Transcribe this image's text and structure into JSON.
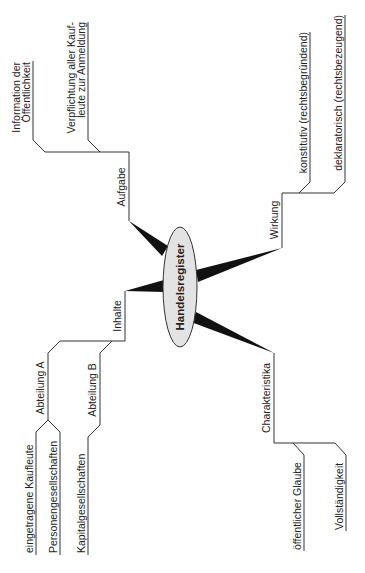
{
  "diagram": {
    "type": "mind-map",
    "orientation": "rotated-90-ccw",
    "center": {
      "label": "Handelsregister",
      "fill": "#e3e3e3"
    },
    "line_color": "#333333",
    "branches": [
      {
        "label": "Aufgabe",
        "children": [
          {
            "lines": [
              "Information der",
              "Öffentlichkeit"
            ]
          },
          {
            "lines": [
              "Verpflichtung aller Kauf-",
              "leute zur Anmeldung"
            ]
          }
        ]
      },
      {
        "label": "Wirkung",
        "children": [
          {
            "lines": [
              "konstitutiv (rechtsbegründend)"
            ]
          },
          {
            "lines": [
              "deklaratorisch (rechtsbezeugend)"
            ]
          }
        ]
      },
      {
        "label": "Inhalte",
        "children": [
          {
            "label": "Abteilung A",
            "children": [
              {
                "lines": [
                  "eingetragene Kaufleute"
                ]
              },
              {
                "lines": [
                  "Personengesellschaften"
                ]
              }
            ]
          },
          {
            "label": "Abteilung B",
            "children": [
              {
                "lines": [
                  "Kapitalgesellschaften"
                ]
              }
            ]
          }
        ]
      },
      {
        "label": "Charakteristika",
        "children": [
          {
            "lines": [
              "öffentlicher Glaube"
            ]
          },
          {
            "lines": [
              "Vollständigkeit"
            ]
          }
        ]
      }
    ]
  }
}
